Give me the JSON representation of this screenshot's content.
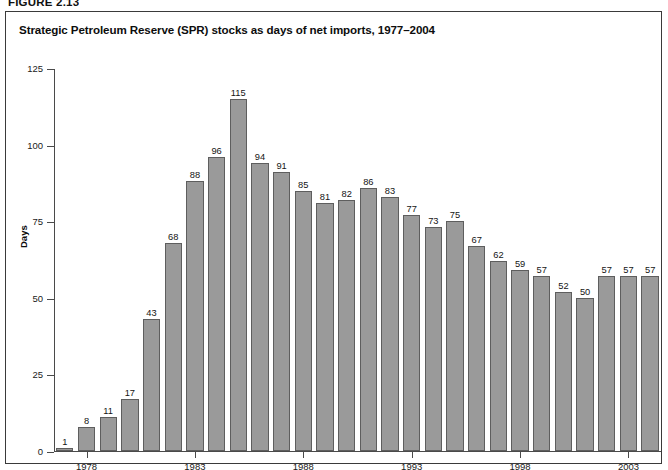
{
  "figure": {
    "caption": "FIGURE 2.13",
    "title": "Strategic Petroleum Reserve (SPR) stocks as days of net imports, 1977–2004"
  },
  "chart_data": {
    "type": "bar",
    "title": "Strategic Petroleum Reserve (SPR) stocks as days of net imports, 1977–2004",
    "xlabel": "",
    "ylabel": "Days",
    "ylim": [
      0,
      125
    ],
    "yticks": [
      0,
      25,
      50,
      75,
      100,
      125
    ],
    "ytick_labels": [
      "0",
      "25",
      "50",
      "75",
      "100",
      "125"
    ],
    "xtick_labels": [
      "1978",
      "1983",
      "1988",
      "1993",
      "1998",
      "2003"
    ],
    "grid": false,
    "legend": null,
    "bar_color": "#9a9a9a",
    "bar_edge_color": "#5e5e5e",
    "data_labels": true,
    "categories": [
      "1977",
      "1978",
      "1979",
      "1980",
      "1981",
      "1982",
      "1983",
      "1984",
      "1985",
      "1986",
      "1987",
      "1988",
      "1989",
      "1990",
      "1991",
      "1992",
      "1993",
      "1994",
      "1995",
      "1996",
      "1997",
      "1998",
      "1999",
      "2000",
      "2001",
      "2002",
      "2003",
      "2004"
    ],
    "values": [
      1,
      8,
      11,
      17,
      43,
      68,
      88,
      96,
      115,
      94,
      91,
      85,
      81,
      82,
      86,
      83,
      77,
      73,
      75,
      67,
      62,
      59,
      57,
      52,
      50,
      57,
      57,
      57
    ]
  }
}
